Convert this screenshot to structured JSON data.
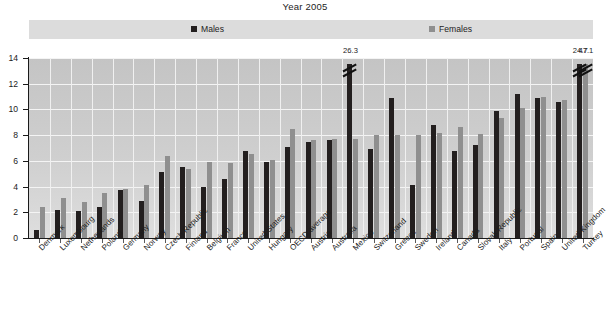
{
  "chart_data": {
    "type": "bar",
    "title": "Year 2005",
    "xlabel": "",
    "ylabel": "",
    "ylim": [
      0,
      14
    ],
    "ytick_labels": [
      "0",
      "2",
      "4",
      "6",
      "8",
      "10",
      "12",
      "14"
    ],
    "grid": true,
    "legend_position": "top",
    "legend": [
      {
        "name": "Males",
        "color": "#231f1f"
      },
      {
        "name": "Females",
        "color": "#8f8f8f"
      }
    ],
    "categories": [
      "Denmark",
      "Luxembourg",
      "Netherlands",
      "Poland",
      "Germany",
      "Norway",
      "Czech Republic",
      "Finland",
      "Belgium",
      "France",
      "United States",
      "Hungary",
      "OECD average",
      "Austria",
      "Australia",
      "Mexico",
      "Switzerland",
      "Greece",
      "Sweden",
      "Ireland",
      "Canada",
      "Slovak Republic",
      "Italy",
      "Portugal",
      "Spain",
      "United Kingdom",
      "Turkey"
    ],
    "series": [
      {
        "name": "Males",
        "color": "#231f1f",
        "values": [
          0.6,
          2.2,
          2.1,
          2.4,
          3.7,
          2.9,
          5.1,
          5.5,
          4.0,
          4.6,
          6.8,
          5.9,
          7.1,
          7.5,
          7.6,
          26.3,
          6.9,
          10.9,
          4.1,
          8.8,
          6.8,
          7.2,
          9.9,
          11.2,
          10.9,
          10.6,
          24.7
        ]
      },
      {
        "name": "Females",
        "color": "#8f8f8f",
        "values": [
          2.4,
          3.1,
          2.8,
          3.5,
          3.8,
          4.1,
          6.4,
          5.4,
          5.9,
          5.8,
          6.5,
          6.1,
          8.5,
          7.6,
          7.7,
          7.7,
          8.0,
          8.0,
          8.0,
          8.2,
          8.6,
          8.1,
          9.3,
          10.1,
          11.0,
          10.7,
          47.1
        ]
      }
    ],
    "broken_bars": [
      {
        "category": "Mexico",
        "series": "Males",
        "label": "26.3"
      },
      {
        "category": "Turkey",
        "series": "Males",
        "label": "24.7"
      },
      {
        "category": "Turkey",
        "series": "Females",
        "label": "47.1"
      }
    ],
    "annotations": [
      "26.3",
      "24.7",
      "47.1"
    ]
  }
}
